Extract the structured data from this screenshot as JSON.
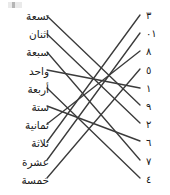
{
  "worksheet": {
    "title": "Arabic number word to numeral matching exercise",
    "line_color": "#3b3b3b",
    "text_color": "#1a1a1a",
    "background_color": "#ffffff"
  },
  "left_column": {
    "name": "number-words",
    "items": [
      {
        "label": "تسعة",
        "value": 9,
        "y": 9
      },
      {
        "label": "اثنان",
        "value": 2,
        "y": 27
      },
      {
        "label": "سبعة",
        "value": 7,
        "y": 45
      },
      {
        "label": "واحد",
        "value": 1,
        "y": 64
      },
      {
        "label": "أربعة",
        "value": 4,
        "y": 82
      },
      {
        "label": "ستة",
        "value": 6,
        "y": 100
      },
      {
        "label": "ثمانية",
        "value": 8,
        "y": 118
      },
      {
        "label": "ثلاثة",
        "value": 3,
        "y": 136
      },
      {
        "label": "عشرة",
        "value": 10,
        "y": 155
      },
      {
        "label": "خمسة",
        "value": 5,
        "y": 173
      }
    ]
  },
  "right_column": {
    "name": "numerals",
    "items": [
      {
        "label": "٣",
        "value": 3,
        "y": 9
      },
      {
        "label": "١٠",
        "value": 10,
        "y": 27
      },
      {
        "label": "٨",
        "value": 8,
        "y": 45
      },
      {
        "label": "٥",
        "value": 5,
        "y": 64
      },
      {
        "label": "١",
        "value": 1,
        "y": 82
      },
      {
        "label": "٩",
        "value": 9,
        "y": 100
      },
      {
        "label": "٢",
        "value": 2,
        "y": 118
      },
      {
        "label": "٦",
        "value": 6,
        "y": 136
      },
      {
        "label": "٧",
        "value": 7,
        "y": 155
      },
      {
        "label": "٤",
        "value": 4,
        "y": 173
      }
    ]
  },
  "connections": [
    {
      "from_word": "تسعة",
      "to_numeral": "٩",
      "x1": 47,
      "y1": 16,
      "x2": 140,
      "y2": 105
    },
    {
      "from_word": "اثنان",
      "to_numeral": "٢",
      "x1": 47,
      "y1": 34,
      "x2": 140,
      "y2": 123
    },
    {
      "from_word": "سبعة",
      "to_numeral": "٧",
      "x1": 47,
      "y1": 52,
      "x2": 140,
      "y2": 160
    },
    {
      "from_word": "واحد",
      "to_numeral": "١",
      "x1": 47,
      "y1": 70,
      "x2": 140,
      "y2": 88
    },
    {
      "from_word": "أربعة",
      "to_numeral": "٤",
      "x1": 47,
      "y1": 88,
      "x2": 140,
      "y2": 178
    },
    {
      "from_word": "ستة",
      "to_numeral": "٦",
      "x1": 47,
      "y1": 106,
      "x2": 140,
      "y2": 141
    },
    {
      "from_word": "ثمانية",
      "to_numeral": "٨",
      "x1": 47,
      "y1": 124,
      "x2": 140,
      "y2": 51
    },
    {
      "from_word": "ثلاثة",
      "to_numeral": "٣",
      "x1": 47,
      "y1": 142,
      "x2": 140,
      "y2": 15
    },
    {
      "from_word": "عشرة",
      "to_numeral": "١٠",
      "x1": 47,
      "y1": 160,
      "x2": 140,
      "y2": 33
    },
    {
      "from_word": "خمسة",
      "to_numeral": "٥",
      "x1": 47,
      "y1": 178,
      "x2": 140,
      "y2": 69
    }
  ]
}
